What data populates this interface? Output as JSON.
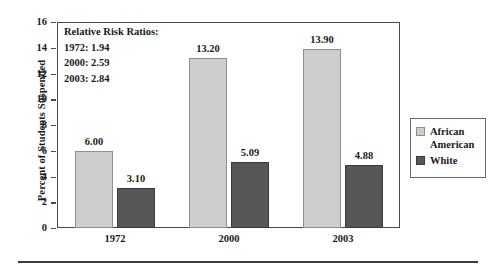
{
  "chart_data": {
    "type": "bar",
    "title": "",
    "xlabel": "",
    "ylabel": "Percent of Students Suspended",
    "categories": [
      "1972",
      "2000",
      "2003"
    ],
    "series": [
      {
        "name": "African American",
        "values": [
          6.0,
          13.2,
          13.9
        ],
        "labels": [
          "6.00",
          "13.20",
          "13.90"
        ],
        "color": "#cdcdcd"
      },
      {
        "name": "White",
        "values": [
          3.1,
          5.09,
          4.88
        ],
        "labels": [
          "3.10",
          "5.09",
          "4.88"
        ],
        "color": "#575757"
      }
    ],
    "ylim": [
      0,
      16
    ],
    "yticks": [
      0,
      2,
      4,
      6,
      8,
      10,
      12,
      14,
      16
    ],
    "ytick_labels": [
      "0",
      "2",
      "4",
      "6",
      "8",
      "10",
      "12",
      "14",
      "16"
    ],
    "grid": false,
    "legend_position": "right"
  },
  "annotation": {
    "heading": "Relative Risk Ratios:",
    "lines": [
      "1972: 1.94",
      "2000: 2.59",
      "2003: 2.84"
    ]
  },
  "legend": {
    "entries": [
      {
        "label": "African American",
        "color": "#cdcdcd"
      },
      {
        "label": "White",
        "color": "#575757"
      }
    ]
  }
}
